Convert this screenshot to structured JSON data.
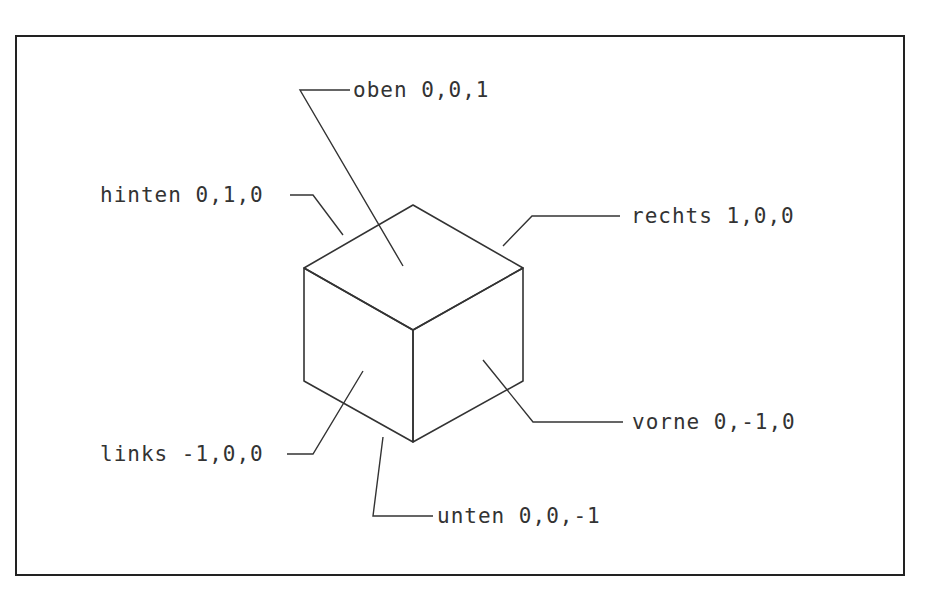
{
  "diagram": {
    "type": "isometric-cube-face-orientation",
    "labels": {
      "top": {
        "name": "oben",
        "vector": "0,0,1"
      },
      "back": {
        "name": "hinten",
        "vector": "0,1,0"
      },
      "right": {
        "name": "rechts",
        "vector": "1,0,0"
      },
      "front": {
        "name": "vorne",
        "vector": "0,-1,0"
      },
      "left": {
        "name": "links",
        "vector": "-1,0,0"
      },
      "bottom": {
        "name": "unten",
        "vector": "0,0,-1"
      }
    },
    "texts": {
      "top": "oben 0,0,1",
      "back": "hinten 0,1,0",
      "right": "rechts 1,0,0",
      "front": "vorne 0,-1,0",
      "left": "links -1,0,0",
      "bottom": "unten 0,0,-1"
    },
    "colors": {
      "line": "#333333",
      "background": "#ffffff"
    }
  }
}
